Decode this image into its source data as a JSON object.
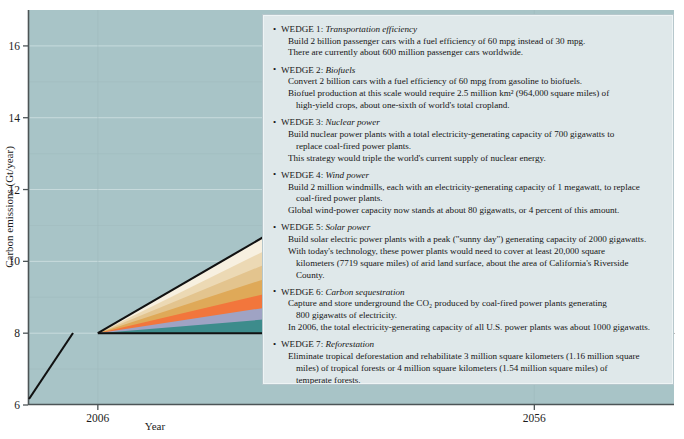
{
  "figure": {
    "plot_bg_color": "#a8c4c7",
    "panel_bg_color": "#dfe8ea"
  },
  "chart_data": {
    "type": "area",
    "title": "",
    "xlabel": "Year",
    "ylabel": "Carbon emissions (Gt/year)",
    "xlim": [
      1998,
      2072
    ],
    "ylim": [
      6,
      17
    ],
    "xticks": [
      2006,
      2056
    ],
    "xtick_labels": [
      "2006",
      "2056"
    ],
    "yticks": [
      6,
      8,
      10,
      12,
      14,
      16
    ],
    "ytick_labels": [
      "6",
      "8",
      "10",
      "12",
      "14",
      "16"
    ],
    "y_gridlines": [
      7,
      8,
      9,
      10,
      11,
      12,
      13,
      14,
      15,
      16
    ],
    "grid": true,
    "legend": "none",
    "annotations": [
      {
        "name": "business-as-usual",
        "text": "Business-as-usual",
        "type": "arrow",
        "x0": 2006,
        "y0": 8,
        "x1": 2062,
        "y1": 15.9
      },
      {
        "name": "stabilization",
        "text": "Stabilization",
        "type": "arrow",
        "x0": 2006,
        "y0": 8,
        "x1": 2072,
        "y1": 8
      }
    ],
    "baseline_start": {
      "x": 1998,
      "y": 6.35
    },
    "wedge_apex": {
      "x": 2006,
      "y": 8.0
    },
    "wedge_right_x": 2056,
    "stack_top_at_2056": 15.0,
    "series": [
      {
        "name": "Reforestation",
        "color": "#3d8c8c",
        "y_2006": 8.0,
        "y_2056": 9.0
      },
      {
        "name": "Carbon sequestration",
        "color": "#9fa3c4",
        "y_2006": 8.0,
        "y_2056": 9.85
      },
      {
        "name": "Solar power",
        "color": "#f2763c",
        "y_2006": 8.0,
        "y_2056": 10.85
      },
      {
        "name": "Wind power",
        "color": "#dfa958",
        "y_2006": 8.0,
        "y_2056": 11.95
      },
      {
        "name": "Nuclear power",
        "color": "#e3c48e",
        "y_2006": 8.0,
        "y_2056": 13.0
      },
      {
        "name": "Biofuels",
        "color": "#ecd9b4",
        "y_2006": 8.0,
        "y_2056": 14.0
      },
      {
        "name": "Transportation efficiency",
        "color": "#f7f0e0",
        "y_2006": 8.0,
        "y_2056": 15.0
      }
    ]
  },
  "panel": {
    "wedges": [
      {
        "bullet": "•",
        "number": "WEDGE 1:",
        "name": "Transportation efficiency",
        "lines": [
          {
            "text": "Build 2 billion passenger cars with a fuel efficiency of 60 mpg instead of 30 mpg.",
            "indent": false
          },
          {
            "text": "There are currently about 600 million passenger cars worldwide.",
            "indent": false
          }
        ]
      },
      {
        "bullet": "•",
        "number": "WEDGE 2:",
        "name": "Biofuels",
        "lines": [
          {
            "text": "Convert 2 billion cars with a fuel efficiency of 60 mpg from gasoline to biofuels.",
            "indent": false
          },
          {
            "text": "Biofuel production at this scale would require 2.5 million km² (964,000 square miles) of",
            "indent": false
          },
          {
            "text": "high-yield crops, about one-sixth of world's total cropland.",
            "indent": true
          }
        ]
      },
      {
        "bullet": "•",
        "number": "WEDGE 3:",
        "name": "Nuclear power",
        "lines": [
          {
            "text": "Build nuclear power plants with a total electricity-generating capacity of 700 gigawatts to",
            "indent": false
          },
          {
            "text": "replace coal-fired power plants.",
            "indent": true
          },
          {
            "text": "This strategy would triple the world's current supply of nuclear energy.",
            "indent": false
          }
        ]
      },
      {
        "bullet": "•",
        "number": "WEDGE 4:",
        "name": "Wind power",
        "lines": [
          {
            "text": "Build 2 million windmills, each with an electricity-generating capacity of 1 megawatt, to replace",
            "indent": false
          },
          {
            "text": "coal-fired power plants.",
            "indent": true
          },
          {
            "text": "Global wind-power capacity now stands at about 80 gigawatts, or 4 percent of this amount.",
            "indent": false
          }
        ]
      },
      {
        "bullet": "•",
        "number": "WEDGE 5:",
        "name": "Solar power",
        "lines": [
          {
            "text": "Build solar electric power plants with a peak (\"sunny day\") generating capacity of 2000 gigawatts.",
            "indent": false
          },
          {
            "text": "With today's technology, these power plants would need to cover at least 20,000 square",
            "indent": false
          },
          {
            "text": "kilometers (7719 square miles) of arid land surface, about the area of California's Riverside",
            "indent": true
          },
          {
            "text": "County.",
            "indent": true
          }
        ]
      },
      {
        "bullet": "•",
        "number": "WEDGE 6:",
        "name": "Carbon sequestration",
        "lines": [
          {
            "text": "Capture and store underground the CO₂ produced by coal-fired power plants generating",
            "indent": false
          },
          {
            "text": "800 gigawatts of electricity.",
            "indent": true
          },
          {
            "text": "In 2006, the total electricity-generating capacity of all U.S. power plants was about 1000 gigawatts.",
            "indent": false
          }
        ]
      },
      {
        "bullet": "•",
        "number": "WEDGE 7:",
        "name": "Reforestation",
        "lines": [
          {
            "text": "Eliminate tropical deforestation and rehabilitate 3 million square kilometers (1.16 million square",
            "indent": false
          },
          {
            "text": "miles) of tropical forests or 4 million square kilometers (1.54 million square miles) of",
            "indent": true
          },
          {
            "text": "temperate forests.",
            "indent": true
          },
          {
            "text": "The latter area is about half the size of Australia.",
            "indent": false
          }
        ]
      }
    ]
  }
}
